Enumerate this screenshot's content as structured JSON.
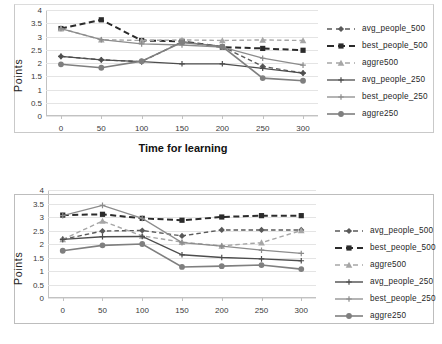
{
  "figures": [
    {
      "id": "top",
      "ylabel": "Points",
      "xtitle": "Time for learning",
      "chart": {
        "type": "line",
        "title": "",
        "xlabel": "Time for learning",
        "ylabel": "Points",
        "x": [
          0,
          50,
          100,
          150,
          200,
          250,
          300
        ],
        "xticklabels": [
          "0",
          "50",
          "100",
          "150",
          "200",
          "250",
          "300"
        ],
        "yticklabels": [
          "0",
          "0.5",
          "1",
          "1.5",
          "2",
          "2.5",
          "3",
          "3.5",
          "4"
        ],
        "ylim": [
          0,
          4
        ],
        "ytickstep": 0.5,
        "grid": "horizontal",
        "legend_position": "right",
        "series": [
          {
            "name": "avg_people_500",
            "color": "#595959",
            "style": "dashed",
            "marker": "diamond",
            "width": 1.4,
            "values": [
              2.25,
              2.12,
              2.05,
              2.8,
              2.62,
              1.87,
              1.62
            ]
          },
          {
            "name": "best_people_500",
            "color": "#2b2b2b",
            "style": "dashed",
            "marker": "square",
            "width": 2.0,
            "values": [
              3.3,
              3.63,
              2.85,
              2.82,
              2.6,
              2.55,
              2.48
            ]
          },
          {
            "name": "aggre500",
            "color": "#a6a6a6",
            "style": "dashed",
            "marker": "triangle",
            "width": 1.4,
            "values": [
              3.3,
              2.88,
              2.85,
              2.87,
              2.85,
              2.87,
              2.85
            ]
          },
          {
            "name": "avg_people_250",
            "color": "#4d4d4d",
            "style": "solid",
            "marker": "plus",
            "width": 1.3,
            "values": [
              2.25,
              2.12,
              2.05,
              1.97,
              1.97,
              1.8,
              1.62
            ]
          },
          {
            "name": "best_people_250",
            "color": "#8c8c8c",
            "style": "solid",
            "marker": "plus",
            "width": 1.3,
            "values": [
              3.3,
              2.88,
              2.72,
              2.68,
              2.6,
              2.18,
              1.92
            ]
          },
          {
            "name": "aggre250",
            "color": "#7f7f7f",
            "style": "solid",
            "marker": "circle",
            "width": 1.6,
            "values": [
              1.95,
              1.82,
              2.07,
              2.78,
              2.62,
              1.43,
              1.33
            ]
          }
        ]
      }
    },
    {
      "id": "bottom",
      "ylabel": "Points",
      "xtitle": "",
      "chart": {
        "type": "line",
        "title": "",
        "xlabel": "",
        "ylabel": "Points",
        "x": [
          0,
          50,
          100,
          150,
          200,
          250,
          300
        ],
        "xticklabels": [
          "0",
          "50",
          "100",
          "150",
          "200",
          "250",
          "300"
        ],
        "yticklabels": [
          "0",
          "0.5",
          "1",
          "1.5",
          "2",
          "2.5",
          "3",
          "3.5",
          "4"
        ],
        "ylim": [
          0,
          4
        ],
        "ytickstep": 0.5,
        "grid": "horizontal",
        "legend_position": "right",
        "series": [
          {
            "name": "avg_people_500",
            "color": "#595959",
            "style": "dashed",
            "marker": "diamond",
            "width": 1.4,
            "values": [
              2.17,
              2.48,
              2.5,
              2.3,
              2.52,
              2.52,
              2.52
            ]
          },
          {
            "name": "best_people_500",
            "color": "#2b2b2b",
            "style": "dashed",
            "marker": "square",
            "width": 2.0,
            "values": [
              3.07,
              3.1,
              2.95,
              2.88,
              3.0,
              3.05,
              3.05
            ]
          },
          {
            "name": "aggre500",
            "color": "#a6a6a6",
            "style": "dashed",
            "marker": "triangle",
            "width": 1.4,
            "values": [
              2.17,
              2.85,
              2.3,
              2.07,
              1.93,
              2.05,
              2.5
            ]
          },
          {
            "name": "avg_people_250",
            "color": "#4d4d4d",
            "style": "solid",
            "marker": "plus",
            "width": 1.4,
            "values": [
              2.17,
              2.27,
              2.28,
              1.6,
              1.5,
              1.45,
              1.38
            ]
          },
          {
            "name": "best_people_250",
            "color": "#8c8c8c",
            "style": "solid",
            "marker": "plus",
            "width": 1.3,
            "values": [
              3.05,
              3.43,
              2.95,
              2.05,
              1.92,
              1.77,
              1.65
            ]
          },
          {
            "name": "aggre250",
            "color": "#7f7f7f",
            "style": "solid",
            "marker": "circle",
            "width": 1.6,
            "values": [
              1.75,
              1.95,
              2.0,
              1.15,
              1.18,
              1.22,
              1.07
            ]
          }
        ]
      }
    }
  ]
}
